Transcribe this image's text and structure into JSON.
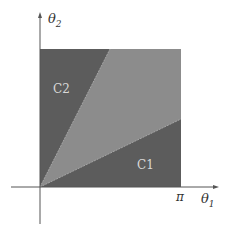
{
  "diagram": {
    "axes": {
      "x_label": "θ",
      "x_sub": "1",
      "y_label": "θ",
      "y_sub": "2",
      "x_tick": "π"
    },
    "regions": [
      {
        "name": "C2",
        "label": "C2",
        "color": "#5c5c5c"
      },
      {
        "name": "middle",
        "label": "",
        "color": "#8c8c8c"
      },
      {
        "name": "C1",
        "label": "C1",
        "color": "#5c5c5c"
      }
    ],
    "colors": {
      "dark_region": "#5c5c5c",
      "light_region": "#8c8c8c",
      "axis": "#555555"
    }
  }
}
